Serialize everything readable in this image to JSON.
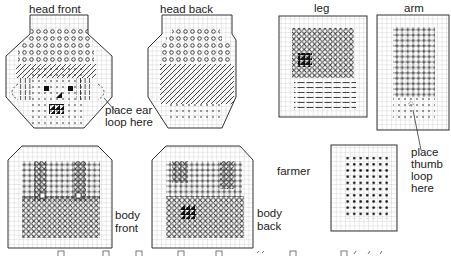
{
  "colors": {
    "grid": "#b9b9b9",
    "outline": "#333333",
    "stitch": "#222222",
    "background": "#ffffff"
  },
  "pieces": [
    {
      "id": "head-front",
      "label": "head front",
      "shape": "octagon",
      "stitches": [
        "circle",
        "diagonal",
        "dot",
        "vertical",
        "solid-block",
        "half-cross"
      ]
    },
    {
      "id": "head-back",
      "label": "head back",
      "shape": "octagon",
      "stitches": [
        "circle",
        "diagonal",
        "dot"
      ]
    },
    {
      "id": "leg",
      "label": "leg",
      "shape": "rectangle",
      "stitches": [
        "cross",
        "half-cross",
        "horizontal"
      ]
    },
    {
      "id": "arm",
      "label": "arm",
      "shape": "rectangle",
      "stitches": [
        "plus",
        "dot"
      ]
    },
    {
      "id": "body-front",
      "label_lines": [
        "body",
        "front"
      ],
      "shape": "clipped-rectangle",
      "stitches": [
        "plus",
        "cross",
        "open-square"
      ]
    },
    {
      "id": "body-back",
      "label_lines": [
        "body",
        "back"
      ],
      "shape": "clipped-rectangle",
      "stitches": [
        "plus",
        "cross",
        "half-cross"
      ]
    },
    {
      "id": "farmer-piece",
      "label": "farmer",
      "shape": "rectangle",
      "stitches": [
        "dot"
      ]
    }
  ],
  "annotations": {
    "ear_loop": [
      "place ear",
      "loop here"
    ],
    "thumb_loop": [
      "place",
      "thumb",
      "loop",
      "here"
    ]
  },
  "legend": {
    "items": [
      {
        "symbol": "square-icon"
      },
      {
        "symbol": "square-icon"
      },
      {
        "symbol": "square-icon"
      },
      {
        "symbol": "square-icon"
      },
      {
        "symbol": "square-icon"
      },
      {
        "symbol": "square-icon"
      },
      {
        "symbol": "square-icon"
      }
    ]
  }
}
